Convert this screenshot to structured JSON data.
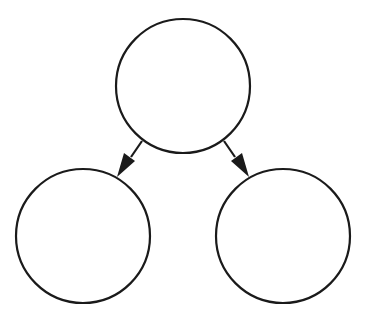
{
  "diagram": {
    "type": "tree",
    "background": "#ffffff",
    "stroke_color": "#1a1a1a",
    "stroke_width": 2.2,
    "nodes": [
      {
        "id": "root",
        "label": "",
        "cx": 183,
        "cy": 86,
        "r": 67
      },
      {
        "id": "left-child",
        "label": "",
        "cx": 83,
        "cy": 236,
        "r": 67
      },
      {
        "id": "right-child",
        "label": "",
        "cx": 283,
        "cy": 236,
        "r": 67
      }
    ],
    "edges": [
      {
        "from": "root",
        "to": "left-child",
        "x1": 142,
        "y1": 141,
        "x2": 118,
        "y2": 176
      },
      {
        "from": "root",
        "to": "right-child",
        "x1": 224,
        "y1": 141,
        "x2": 248,
        "y2": 176
      }
    ]
  }
}
